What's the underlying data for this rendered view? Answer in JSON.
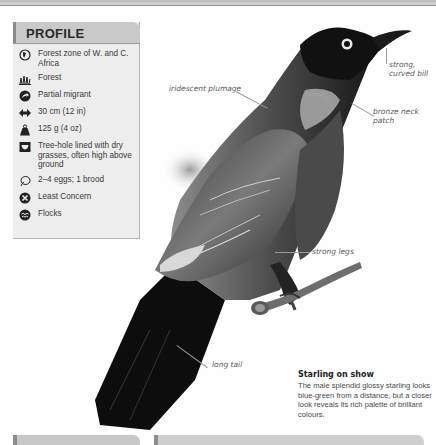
{
  "profile": {
    "title": "PROFILE",
    "items": [
      {
        "icon": "globe-distribution-icon",
        "text": "Forest zone of W. and C. Africa"
      },
      {
        "icon": "habitat-grass-icon",
        "text": "Forest"
      },
      {
        "icon": "migration-arrow-icon",
        "text": "Partial migrant"
      },
      {
        "icon": "length-arrows-icon",
        "text": "30 cm (12 in)"
      },
      {
        "icon": "weight-icon",
        "text": "125 g (4 oz)"
      },
      {
        "icon": "nest-icon",
        "text": "Tree-hole lined with dry grasses, often high above ground"
      },
      {
        "icon": "egg-icon",
        "text": "2–4 eggs; 1 brood"
      },
      {
        "icon": "conservation-status-icon",
        "text": "Least Concern"
      },
      {
        "icon": "social-flock-icon",
        "text": "Flocks"
      }
    ]
  },
  "callouts": {
    "bill": "strong, curved bill",
    "bill_line1": "strong,",
    "bill_line2": "curved bill",
    "plumage": "iridescent plumage",
    "neck": "bronze neck patch",
    "neck_line1": "bronze neck",
    "neck_line2": "patch",
    "legs": "strong legs",
    "tail": "long tail"
  },
  "caption": {
    "title": "Starling on show",
    "body": "The male splendid glossy starling looks blue-green from a distance, but a closer look reveals its rich palette of brilliant colours."
  },
  "colors": {
    "header_bg": "#c9c9c9",
    "box_bg": "#ededed",
    "accent_bar": "#8a8a8a"
  }
}
